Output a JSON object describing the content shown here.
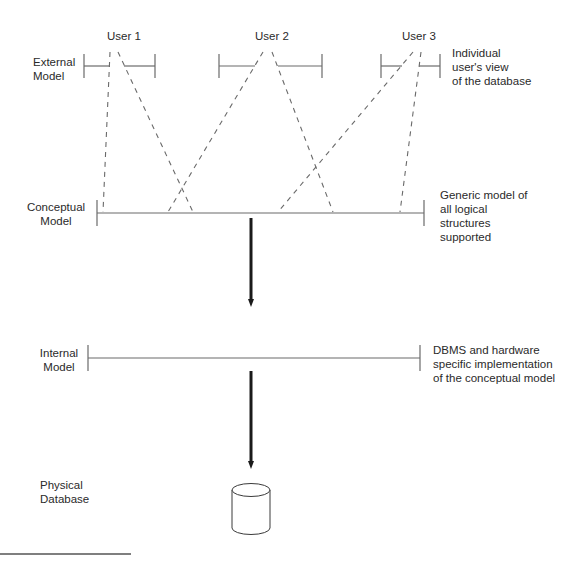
{
  "users": [
    {
      "label": "User 1"
    },
    {
      "label": "User 2"
    },
    {
      "label": "User 3"
    }
  ],
  "levels": {
    "external": {
      "name": "External\nModel",
      "description": "Individual\nuser's view\nof the database"
    },
    "conceptual": {
      "name": "Conceptual\nModel",
      "description": "Generic model of\nall logical\nstructures\nsupported"
    },
    "internal": {
      "name": "Internal\nModel",
      "description": "DBMS and hardware\nspecific implementation\nof the conceptual model"
    },
    "physical": {
      "name": "Physical\nDatabase"
    }
  },
  "colors": {
    "line": "#6a6a6a",
    "arrow": "#1a1a1a",
    "text": "#2a2a2a"
  }
}
